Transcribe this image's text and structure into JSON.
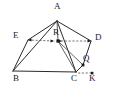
{
  "figure": {
    "background_color": "#ffffff",
    "line_color": "#2b2b2b",
    "dash_color": "#555555",
    "dot_color": "#1a1a1a",
    "width": 114,
    "height": 93
  },
  "points": [
    {
      "id": "A",
      "label": "A",
      "x": 57,
      "y": 21,
      "label_x": 54,
      "label_y": 3,
      "dot": false
    },
    {
      "id": "E",
      "label": "E",
      "x": 28,
      "y": 40,
      "label_x": 13,
      "label_y": 33,
      "dot": false
    },
    {
      "id": "R",
      "label": "R",
      "x": 58,
      "y": 41,
      "label_x": 53,
      "label_y": 28,
      "dot": true
    },
    {
      "id": "D",
      "label": "D",
      "x": 91,
      "y": 41,
      "label_x": 95,
      "label_y": 34,
      "dot": false
    },
    {
      "id": "B",
      "label": "B",
      "x": 13,
      "y": 71,
      "label_x": 13,
      "label_y": 74,
      "dot": false
    },
    {
      "id": "C",
      "label": "C",
      "x": 76,
      "y": 72,
      "label_x": 72,
      "label_y": 74,
      "dot": false
    },
    {
      "id": "Q",
      "label": "Q",
      "x": 83,
      "y": 65,
      "label_x": 83,
      "label_y": 55,
      "dot": true
    },
    {
      "id": "K",
      "label": "K",
      "x": 92,
      "y": 73,
      "label_x": 90,
      "label_y": 74,
      "dot": true
    }
  ],
  "edges": [
    {
      "from": "A",
      "to": "B",
      "style": "solid"
    },
    {
      "from": "A",
      "to": "E",
      "style": "solid"
    },
    {
      "from": "A",
      "to": "D",
      "style": "solid"
    },
    {
      "from": "A",
      "to": "C",
      "style": "solid"
    },
    {
      "from": "A",
      "to": "R",
      "style": "solid"
    },
    {
      "from": "E",
      "to": "B",
      "style": "solid"
    },
    {
      "from": "B",
      "to": "C",
      "style": "solid"
    },
    {
      "from": "D",
      "to": "Q",
      "style": "solid"
    },
    {
      "from": "Q",
      "to": "C",
      "style": "solid"
    },
    {
      "from": "R",
      "to": "C",
      "style": "solid"
    },
    {
      "from": "R",
      "to": "Q",
      "style": "solid"
    },
    {
      "from": "E",
      "to": "R",
      "style": "dashed"
    },
    {
      "from": "R",
      "to": "D",
      "style": "dashed"
    },
    {
      "from": "C",
      "to": "K",
      "style": "dashed"
    }
  ]
}
